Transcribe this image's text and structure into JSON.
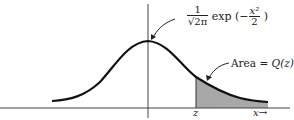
{
  "diagram": {
    "type": "gaussian-tail-area",
    "colors": {
      "curve": "#111111",
      "axis": "#444444",
      "shade": "#a8a8a8",
      "text": "#222222"
    },
    "formula": {
      "numerator": "1",
      "denominator": "√2π",
      "func": "exp",
      "open": "(−",
      "exp_num": "x²",
      "exp_den": "2",
      "close": ")"
    },
    "area_label": {
      "prefix": "Area = ",
      "value": "Q(z)"
    },
    "axis_labels": {
      "z": "z",
      "x": "x→"
    }
  }
}
